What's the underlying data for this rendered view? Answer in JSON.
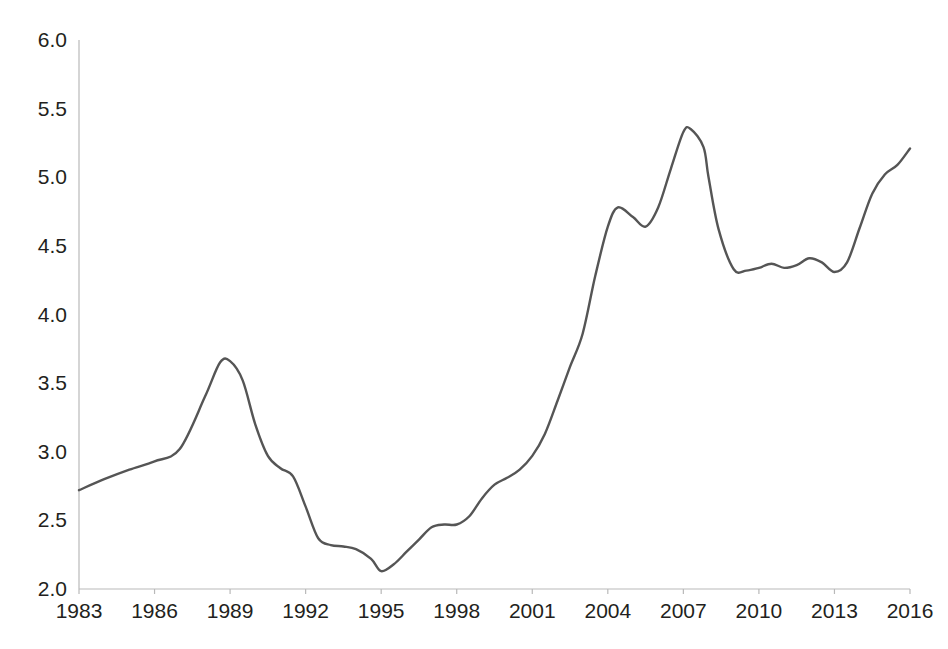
{
  "chart_data": {
    "type": "line",
    "title": "",
    "subtitle": "",
    "xlabel": "",
    "ylabel": "",
    "xlim": [
      1983,
      2016
    ],
    "ylim": [
      2.0,
      6.0
    ],
    "grid": false,
    "legend": "none",
    "axis_color": "#b9b9b9",
    "line_color": "#555555",
    "background_color": "#ffffff",
    "x_tick_labels": [
      "1983",
      "1986",
      "1989",
      "1992",
      "1995",
      "1998",
      "2001",
      "2004",
      "2007",
      "2010",
      "2013",
      "2016"
    ],
    "x_ticks": [
      1983,
      1986,
      1989,
      1992,
      1995,
      1998,
      2001,
      2004,
      2007,
      2010,
      2013,
      2016
    ],
    "y_tick_labels": [
      "2.0",
      "2.5",
      "3.0",
      "3.5",
      "4.0",
      "4.5",
      "5.0",
      "5.5",
      "6.0"
    ],
    "y_ticks": [
      2.0,
      2.5,
      3.0,
      3.5,
      4.0,
      4.5,
      5.0,
      5.5,
      6.0
    ],
    "series": [
      {
        "name": "series-1",
        "color": "#555555",
        "x": [
          1983,
          1984,
          1985,
          1986,
          1987,
          1988,
          1988.6,
          1989,
          1989.5,
          1990,
          1990.5,
          1991,
          1991.5,
          1992,
          1992.5,
          1993,
          1993.5,
          1994,
          1994.6,
          1995,
          1995.5,
          1996,
          1996.5,
          1997,
          1997.5,
          1998,
          1998.5,
          1999,
          1999.5,
          2000,
          2000.5,
          2001,
          2001.5,
          2002,
          2002.5,
          2003,
          2003.5,
          2004,
          2004.4,
          2005,
          2005.5,
          2006,
          2006.5,
          2007,
          2007.3,
          2007.8,
          2008,
          2008.4,
          2009,
          2009.5,
          2010,
          2010.5,
          2011,
          2011.5,
          2012,
          2012.5,
          2013,
          2013.5,
          2014,
          2014.5,
          2015,
          2015.5,
          2016
        ],
        "y": [
          2.72,
          2.8,
          2.87,
          2.93,
          3.02,
          3.4,
          3.65,
          3.66,
          3.52,
          3.2,
          2.97,
          2.88,
          2.82,
          2.6,
          2.37,
          2.32,
          2.31,
          2.29,
          2.22,
          2.13,
          2.18,
          2.27,
          2.36,
          2.45,
          2.47,
          2.47,
          2.53,
          2.66,
          2.76,
          2.81,
          2.87,
          2.97,
          3.13,
          3.37,
          3.62,
          3.86,
          4.28,
          4.64,
          4.78,
          4.71,
          4.64,
          4.78,
          5.06,
          5.33,
          5.35,
          5.22,
          5.0,
          4.62,
          4.33,
          4.32,
          4.34,
          4.37,
          4.34,
          4.36,
          4.41,
          4.38,
          4.31,
          4.38,
          4.63,
          4.88,
          5.02,
          5.09,
          5.21
        ]
      }
    ]
  }
}
